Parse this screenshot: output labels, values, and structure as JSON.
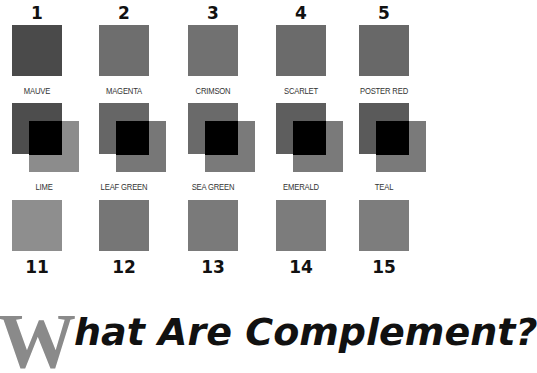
{
  "row1": {
    "numbers": [
      "1",
      "2",
      "3",
      "4",
      "5"
    ],
    "labels": [
      "MAUVE",
      "MAGENTA",
      "CRIMSON",
      "SCARLET",
      "POSTER RED"
    ],
    "colors": [
      "#4a4a4a",
      "#6e6e6e",
      "#717171",
      "#6b6b6b",
      "#686868"
    ]
  },
  "row2": {
    "labels": [
      "LIME",
      "LEAF GREEN",
      "SEA GREEN",
      "EMERALD",
      "TEAL"
    ],
    "back_colors": [
      "#4d4d4d",
      "#666666",
      "#6a6a6a",
      "#5e5e5e",
      "#5a5a5a"
    ],
    "front_colors": [
      "#8c8c8c",
      "#777777",
      "#7a7a7a",
      "#7a7a7a",
      "#7a7a7a"
    ],
    "overlap_color": "#000000"
  },
  "row3": {
    "numbers": [
      "11",
      "12",
      "13",
      "14",
      "15"
    ],
    "colors": [
      "#8e8e8e",
      "#767676",
      "#7a7a7a",
      "#7c7c7c",
      "#7d7d7d"
    ]
  },
  "heading": {
    "drop_cap": "W",
    "rest": "hat Are Complement?"
  }
}
